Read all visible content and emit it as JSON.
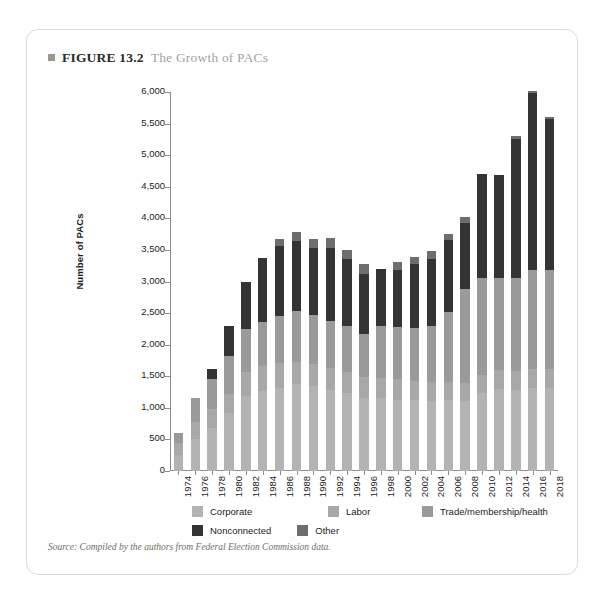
{
  "figure": {
    "marker_icon": "square-bullet-icon",
    "label": "FIGURE 13.2",
    "title": "The Growth of PACs"
  },
  "source": "Source: Compiled by the authors from Federal Election Commission data.",
  "colors": {
    "corporate": "#b3b3b3",
    "labor": "#a8a8a8",
    "trade": "#9a9a9a",
    "nonconnected": "#343434",
    "other": "#6e6e6e",
    "axis": "#8d8d8d",
    "text": "#1c1c1c",
    "card_border": "#dddbd8",
    "title_muted": "#a5a3a0"
  },
  "chart_data": {
    "type": "bar",
    "subtype": "stacked",
    "title": "The Growth of PACs",
    "xlabel": "",
    "ylabel": "Number of PACs",
    "ylim": [
      0,
      6000
    ],
    "ytick_step": 500,
    "grid": false,
    "legend_position": "bottom",
    "categories": [
      "1974",
      "1976",
      "1978",
      "1980",
      "1982",
      "1984",
      "1986",
      "1988",
      "1990",
      "1992",
      "1994",
      "1996",
      "1998",
      "2000",
      "2002",
      "2004",
      "2006",
      "2008",
      "2010",
      "2012",
      "2014",
      "2016",
      "2018"
    ],
    "ytick_labels": [
      "0",
      "500",
      "1,000",
      "1,500",
      "2,000",
      "2,500",
      "3,000",
      "3,500",
      "4,000",
      "4,500",
      "5,000",
      "5,500",
      "6,000"
    ],
    "series": [
      {
        "name": "Corporate",
        "color_key": "corporate",
        "values": [
          250,
          500,
          680,
          920,
          1180,
          1270,
          1320,
          1370,
          1350,
          1290,
          1230,
          1160,
          1150,
          1130,
          1120,
          1110,
          1120,
          1110,
          1230,
          1300,
          1290,
          1320,
          1320
        ]
      },
      {
        "name": "Labor",
        "color_key": "labor",
        "values": [
          200,
          280,
          300,
          300,
          380,
          390,
          390,
          360,
          350,
          340,
          330,
          330,
          320,
          320,
          310,
          300,
          290,
          290,
          290,
          300,
          290,
          290,
          290
        ]
      },
      {
        "name": "Trade/membership/health",
        "color_key": "trade",
        "values": [
          150,
          370,
          470,
          600,
          690,
          700,
          750,
          800,
          770,
          750,
          730,
          680,
          820,
          830,
          840,
          890,
          1100,
          1480,
          1530,
          1460,
          1470,
          1570,
          1570
        ]
      },
      {
        "name": "Nonconnected",
        "color_key": "nonconnected",
        "values": [
          0,
          0,
          160,
          480,
          750,
          1020,
          1110,
          1110,
          1060,
          1150,
          1060,
          950,
          910,
          900,
          1000,
          1060,
          1150,
          1050,
          1650,
          1620,
          2200,
          2800,
          2400
        ]
      },
      {
        "name": "Other",
        "color_key": "other",
        "values": [
          0,
          0,
          0,
          0,
          0,
          0,
          110,
          140,
          150,
          160,
          150,
          150,
          0,
          130,
          120,
          120,
          100,
          90,
          0,
          0,
          60,
          40,
          20
        ]
      }
    ],
    "totals": [
      600,
      1150,
      1610,
      2300,
      3000,
      3380,
      3680,
      3780,
      3680,
      3690,
      3500,
      3270,
      3200,
      3310,
      3390,
      3480,
      3760,
      4020,
      4700,
      4680,
      5310,
      6020,
      5600
    ]
  }
}
